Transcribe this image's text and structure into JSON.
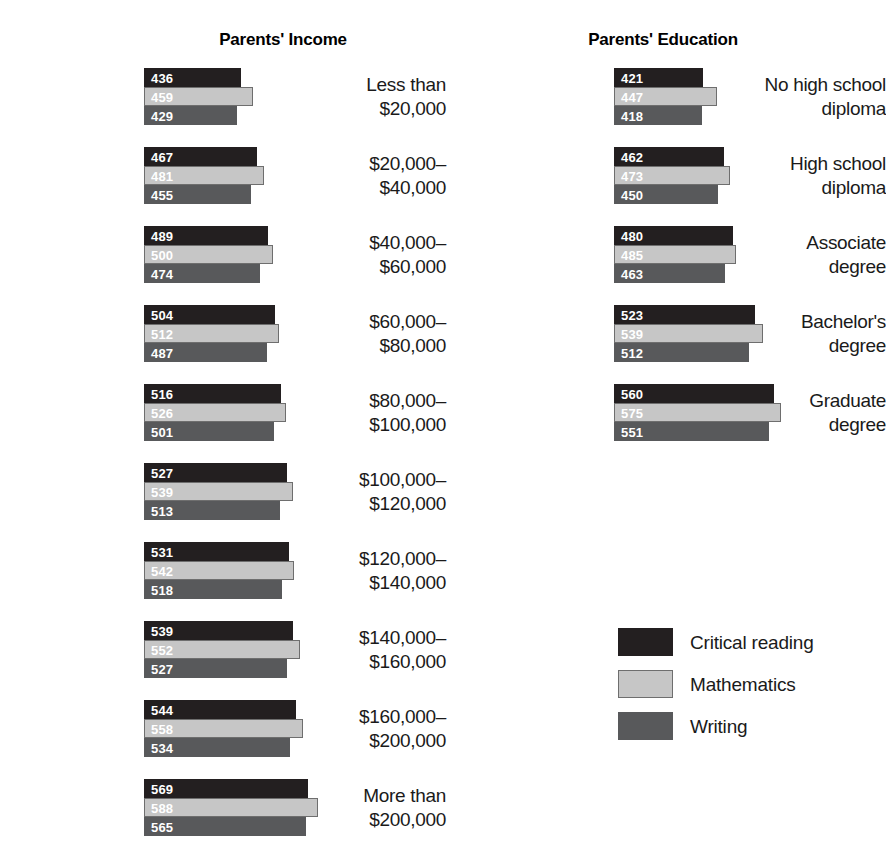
{
  "chart_data": {
    "type": "bar",
    "orientation": "horizontal",
    "title": "",
    "xlabel": "",
    "ylabel": "",
    "grid": false,
    "legend_position": "bottom-right",
    "value_axis_note": "Bars are drawn on a truncated scale; bar length is proportional to (score - 244) approximately, matching the printed figure.",
    "series_names": [
      "Critical reading",
      "Mathematics",
      "Writing"
    ],
    "series_colors": [
      "#231f20",
      "#c6c6c6",
      "#58595b"
    ],
    "panels": [
      {
        "id": "income",
        "title": "Parents' Income",
        "categories": [
          "Less than\n$20,000",
          "$20,000–\n$40,000",
          "$40,000–\n$60,000",
          "$60,000–\n$80,000",
          "$80,000–\n$100,000",
          "$100,000–\n$120,000",
          "$120,000–\n$140,000",
          "$140,000–\n$160,000",
          "$160,000–\n$200,000",
          "More than\n$200,000"
        ],
        "series": [
          {
            "name": "Critical reading",
            "values": [
              436,
              467,
              489,
              504,
              516,
              527,
              531,
              539,
              544,
              569
            ]
          },
          {
            "name": "Mathematics",
            "values": [
              459,
              481,
              500,
              512,
              526,
              539,
              542,
              552,
              558,
              588
            ]
          },
          {
            "name": "Writing",
            "values": [
              429,
              455,
              474,
              487,
              501,
              513,
              518,
              527,
              534,
              565
            ]
          }
        ]
      },
      {
        "id": "education",
        "title": "Parents' Education",
        "categories": [
          "No high school\ndiploma",
          "High school\ndiploma",
          "Associate\ndegree",
          "Bachelor's\ndegree",
          "Graduate\ndegree"
        ],
        "series": [
          {
            "name": "Critical reading",
            "values": [
              421,
              462,
              480,
              523,
              560
            ]
          },
          {
            "name": "Mathematics",
            "values": [
              447,
              473,
              485,
              539,
              575
            ]
          },
          {
            "name": "Writing",
            "values": [
              418,
              450,
              463,
              512,
              551
            ]
          }
        ]
      }
    ],
    "legend": [
      {
        "label": "Critical reading",
        "color": "#231f20"
      },
      {
        "label": "Mathematics",
        "color": "#c6c6c6"
      },
      {
        "label": "Writing",
        "color": "#58595b"
      }
    ]
  }
}
